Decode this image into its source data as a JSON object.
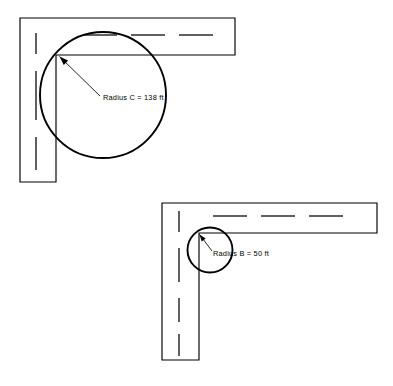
{
  "figure": {
    "background_color": "#ffffff",
    "line_color": "#000000",
    "width": 393,
    "height": 386
  },
  "diagrams": [
    {
      "id": "upper-diagram",
      "name": "large-radius-intersection",
      "label": "Radius C = 138 ft",
      "radius_letter": "C",
      "radius_value": 138,
      "radius_units": "ft",
      "label_x": 103,
      "label_y": 100,
      "circle": {
        "cx": 103,
        "cy": 95,
        "r": 63
      },
      "arrow": {
        "tail_x": 100,
        "tail_y": 96,
        "tip_x": 59.5,
        "tip_y": 56.5
      },
      "roads": {
        "horizontal": {
          "x1": 20,
          "y1": 18,
          "x2": 235,
          "y2": 55
        },
        "vertical": {
          "x1": 20,
          "y1": 18,
          "x2": 56,
          "y2": 182
        }
      },
      "centerlines": {
        "horizontal_y": 35,
        "horizontal_dashes": [
          [
            83,
            117
          ],
          [
            131,
            165
          ],
          [
            179,
            213
          ]
        ],
        "vertical_x": 36,
        "vertical_dashes": [
          [
            33,
            54
          ],
          [
            71,
            120
          ],
          [
            137,
            170
          ]
        ]
      }
    },
    {
      "id": "lower-diagram",
      "name": "small-radius-intersection",
      "label": "Radius B = 50 ft",
      "radius_letter": "B",
      "radius_value": 50,
      "radius_units": "ft",
      "label_x": 213,
      "label_y": 256,
      "circle": {
        "cx": 210,
        "cy": 250,
        "r": 22.5
      },
      "arrow": {
        "tail_x": 212,
        "tail_y": 251,
        "tip_x": 199.5,
        "tip_y": 234.5
      },
      "roads": {
        "horizontal": {
          "x1": 162,
          "y1": 203,
          "x2": 377,
          "y2": 233
        },
        "vertical": {
          "x1": 162,
          "y1": 203,
          "x2": 199,
          "y2": 360
        }
      },
      "centerlines": {
        "horizontal_y": 216,
        "horizontal_dashes": [
          [
            213,
            247
          ],
          [
            261,
            295
          ],
          [
            309,
            343
          ]
        ],
        "vertical_x": 179,
        "vertical_dashes": [
          [
            211,
            232
          ],
          [
            248,
            282
          ],
          [
            298,
            322
          ],
          [
            334,
            356
          ]
        ]
      }
    }
  ]
}
